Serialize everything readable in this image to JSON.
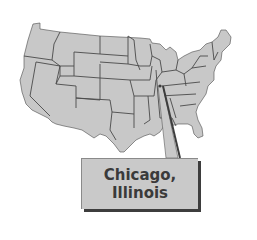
{
  "map": {
    "region": "Contiguous United States",
    "fill_color": "#c8c8c8",
    "border_color": "#4a4a4a",
    "highlighted_location": "Chicago, Illinois"
  },
  "callout": {
    "line1": "Chicago,",
    "line2": "Illinois",
    "box_color": "#c9c9c9",
    "shadow_color": "#3d3d3d",
    "text_color": "#3a3a3a"
  }
}
